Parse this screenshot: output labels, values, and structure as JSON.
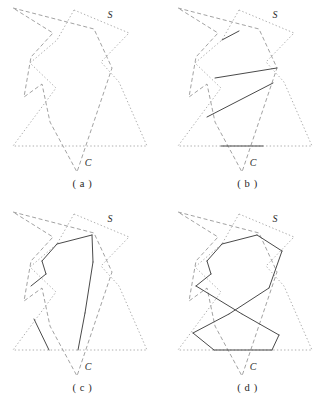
{
  "figure": {
    "type": "geometry-diagram",
    "width": 330,
    "height": 415
  },
  "styles": {
    "dotted_color": "#9a9a9a",
    "dashed_color": "#8a8a8a",
    "solid_color": "#4a4a4a",
    "label_color": "#2b2b2b",
    "background": "#ffffff",
    "dotted_dasharray": "1.4,2.2",
    "dashed_dasharray": "4,2.6",
    "line_width": 0.8,
    "solid_line_width": 1.0
  },
  "labels": {
    "source_polygon": "S",
    "target_polygon": "C"
  },
  "geometry": {
    "polygon_S_dotted": [
      [
        74,
        10
      ],
      [
        129,
        33
      ],
      [
        101,
        62
      ],
      [
        119,
        82
      ],
      [
        147,
        146
      ],
      [
        13,
        146
      ],
      [
        56,
        88
      ],
      [
        30,
        63
      ],
      [
        57,
        40
      ]
    ],
    "polygon_C_dashed": [
      [
        13,
        8
      ],
      [
        94,
        29
      ],
      [
        112,
        68
      ],
      [
        77,
        172
      ],
      [
        50,
        122
      ],
      [
        42,
        84
      ],
      [
        24,
        97
      ],
      [
        31,
        57
      ],
      [
        53,
        33
      ]
    ],
    "label_S_pos": [
      110,
      18
    ],
    "label_C_pos": [
      88,
      166
    ]
  },
  "panels": [
    {
      "id": "a",
      "caption": "( a )",
      "solid_edges": []
    },
    {
      "id": "b",
      "caption": "( b )",
      "solid_edges": [
        [
          [
            57,
            40
          ],
          [
            74,
            31
          ]
        ],
        [
          [
            50,
            78
          ],
          [
            112,
            68
          ]
        ],
        [
          [
            42,
            117
          ],
          [
            108,
            83
          ]
        ],
        [
          [
            56,
            146
          ],
          [
            98,
            146
          ]
        ]
      ]
    },
    {
      "id": "c",
      "caption": "( c )",
      "solid_edges": [
        [
          [
            57,
            40
          ],
          [
            92,
            31
          ]
        ],
        [
          [
            92,
            31
          ],
          [
            93,
            58
          ]
        ],
        [
          [
            57,
            40
          ],
          [
            42,
            57
          ]
        ],
        [
          [
            42,
            57
          ],
          [
            46,
            70
          ]
        ],
        [
          [
            46,
            70
          ],
          [
            31,
            82
          ]
        ],
        [
          [
            93,
            58
          ],
          [
            85,
            109
          ]
        ],
        [
          [
            85,
            109
          ],
          [
            78,
            146
          ]
        ],
        [
          [
            34,
            115
          ],
          [
            49,
            146
          ]
        ]
      ]
    },
    {
      "id": "d",
      "caption": "( d )",
      "solid_edges": [
        [
          [
            57,
            40
          ],
          [
            92,
            31
          ]
        ],
        [
          [
            92,
            31
          ],
          [
            117,
            47
          ]
        ],
        [
          [
            57,
            40
          ],
          [
            42,
            57
          ]
        ],
        [
          [
            42,
            57
          ],
          [
            46,
            70
          ]
        ],
        [
          [
            46,
            70
          ],
          [
            31,
            82
          ]
        ],
        [
          [
            117,
            47
          ],
          [
            104,
            84
          ]
        ],
        [
          [
            31,
            82
          ],
          [
            77,
            110
          ]
        ],
        [
          [
            104,
            84
          ],
          [
            64,
            110
          ]
        ],
        [
          [
            77,
            110
          ],
          [
            114,
            131
          ]
        ],
        [
          [
            64,
            110
          ],
          [
            28,
            129
          ]
        ],
        [
          [
            114,
            131
          ],
          [
            107,
            146
          ]
        ],
        [
          [
            28,
            129
          ],
          [
            49,
            146
          ]
        ],
        [
          [
            49,
            146
          ],
          [
            107,
            146
          ]
        ]
      ]
    }
  ]
}
